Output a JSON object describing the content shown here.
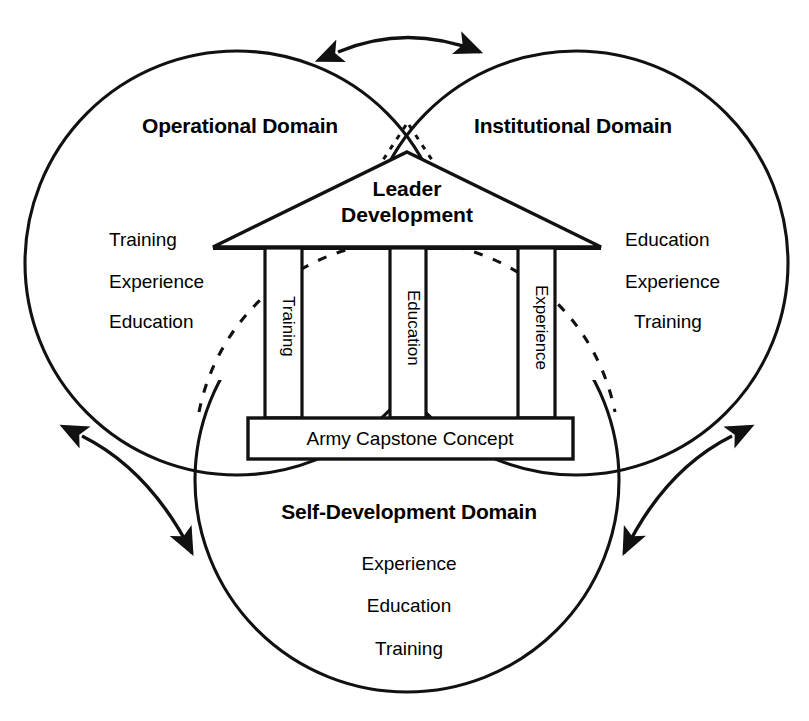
{
  "diagram": {
    "colors": {
      "stroke": "#111111",
      "background": "#ffffff",
      "text": "#000000"
    },
    "domains": [
      {
        "id": "operational",
        "title": "Operational Domain",
        "items": [
          "Training",
          "Experience",
          "Education"
        ]
      },
      {
        "id": "institutional",
        "title": "Institutional Domain",
        "items": [
          "Education",
          "Experience",
          "Training"
        ]
      },
      {
        "id": "self-development",
        "title": "Self-Development Domain",
        "items": [
          "Experience",
          "Education",
          "Training"
        ]
      }
    ],
    "temple": {
      "roof_label_line1": "Leader",
      "roof_label_line2": "Development",
      "pillars": [
        "Training",
        "Education",
        "Experience"
      ],
      "base_label": "Army Capstone Concept"
    },
    "connectors": [
      {
        "id": "top-arrow",
        "name": "operational-institutional-arrow",
        "style": "double-headed-curve"
      },
      {
        "id": "left-arrow",
        "name": "operational-selfdevelopment-arrow",
        "style": "double-headed-curve"
      },
      {
        "id": "right-arrow",
        "name": "institutional-selfdevelopment-arrow",
        "style": "double-headed-curve"
      }
    ]
  }
}
